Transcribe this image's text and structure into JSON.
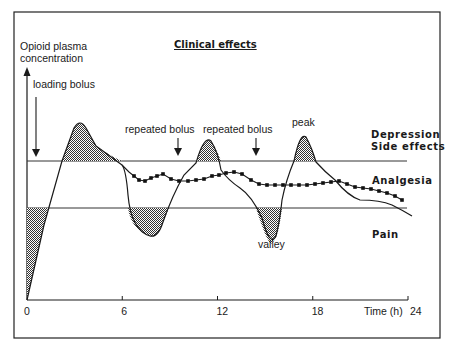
{
  "diagram": {
    "title": "Clinical effects",
    "y_axis_label_line1": "Opioid plasma",
    "y_axis_label_line2": "concentration",
    "x_axis_label": "Time (h)",
    "x_ticks": [
      {
        "value": 0,
        "label": "0"
      },
      {
        "value": 6,
        "label": "6"
      },
      {
        "value": 12,
        "label": "12"
      },
      {
        "value": 18,
        "label": "18"
      },
      {
        "value": 24,
        "label": "24"
      }
    ],
    "zones": {
      "upper": "Depression",
      "upper2": "Side effects",
      "middle": "Analgesia",
      "lower": "Pain"
    },
    "annotations": {
      "loading_bolus": "loading bolus",
      "repeated_bolus_1": "repeated bolus",
      "repeated_bolus_2": "repeated bolus",
      "peak": "peak",
      "valley": "valley"
    },
    "series": [
      {
        "name": "intermittent-bolus-curve",
        "style": "solid"
      },
      {
        "name": "continuous-infusion-curve",
        "style": "square-markers"
      }
    ],
    "colors": {
      "line": "#1a1a1a",
      "hatch": "#555555",
      "threshold": "#333333"
    }
  }
}
